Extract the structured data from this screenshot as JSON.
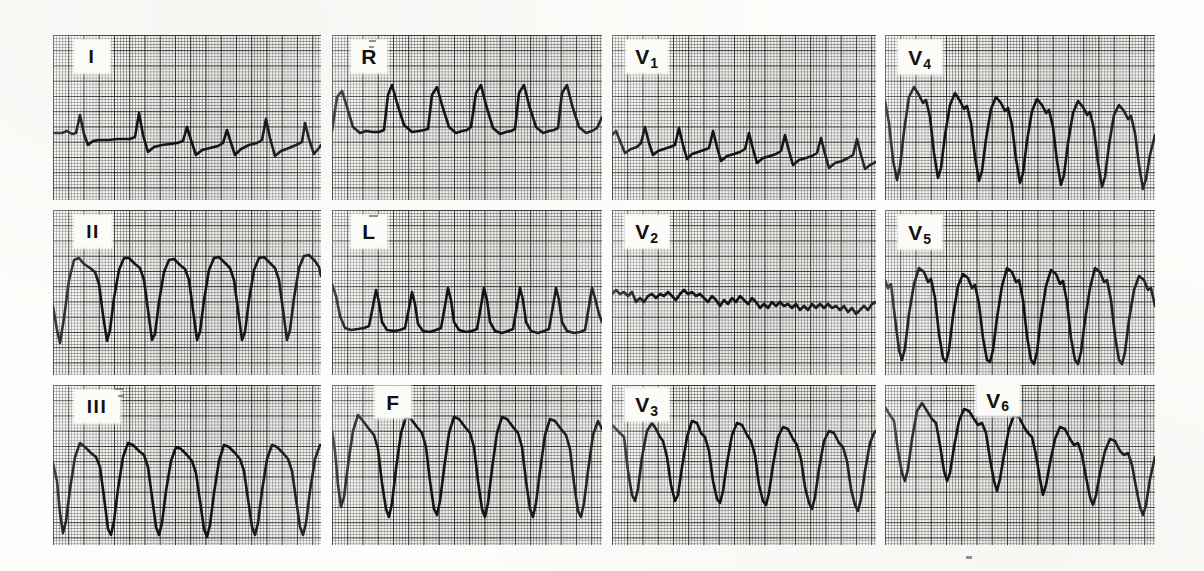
{
  "document": {
    "kind": "12-lead-electrocardiogram",
    "background_color": "#fdfdfb",
    "grid_color": "#282828",
    "trace_color": "#141414",
    "paper_color": "#f6f5f2"
  },
  "chart_data": {
    "type": "line",
    "title": "",
    "xlabel": "",
    "ylabel": "",
    "grid": true,
    "legend_position": "in-panel-label",
    "paper_speed": "25 mm/s",
    "small_square_px": 3.05,
    "large_square_px": 15.25,
    "layout": {
      "rows": 3,
      "columns": 4
    },
    "series": [
      {
        "name": "I",
        "row": 0,
        "col": 0,
        "label": "I",
        "subscript": "",
        "amplitude": "low",
        "morphology": "small upright spikes with shallow negative deflections on a near-isoelectric baseline"
      },
      {
        "name": "aVR",
        "row": 0,
        "col": 1,
        "label": "R",
        "subscript": "",
        "amplitude": "moderate",
        "morphology": "repeating upright peaked complexes with rounded troughs"
      },
      {
        "name": "V1",
        "row": 0,
        "col": 2,
        "label": "V",
        "subscript": "1",
        "amplitude": "low",
        "morphology": "small irregular spikes, mildly negative baseline drift to the right"
      },
      {
        "name": "V4",
        "row": 0,
        "col": 3,
        "label": "V",
        "subscript": "4",
        "amplitude": "very high",
        "morphology": "tall broad positive domes alternating with deep sharp negative spikes"
      },
      {
        "name": "II",
        "row": 1,
        "col": 0,
        "label": "II",
        "subscript": "",
        "amplitude": "very high",
        "morphology": "broad rounded positive plateaus with deep narrow downstrokes"
      },
      {
        "name": "aVL",
        "row": 1,
        "col": 1,
        "label": "L",
        "subscript": "",
        "amplitude": "moderate",
        "morphology": "narrow upright peaks separated by flat depressed baseline segments"
      },
      {
        "name": "V2",
        "row": 1,
        "col": 2,
        "label": "V",
        "subscript": "2",
        "amplitude": "very low",
        "morphology": "fine jagged low-voltage oscillation near the isoelectric line"
      },
      {
        "name": "V5",
        "row": 1,
        "col": 3,
        "label": "V",
        "subscript": "5",
        "amplitude": "very high",
        "morphology": "tall positive domes with notched descent and deep narrow negative spikes"
      },
      {
        "name": "III",
        "row": 2,
        "col": 0,
        "label": "III",
        "subscript": "",
        "amplitude": "very high",
        "morphology": "broad positive plateaus with deep narrow negative deflections"
      },
      {
        "name": "aVF",
        "row": 2,
        "col": 1,
        "label": "F",
        "subscript": "",
        "amplitude": "very high",
        "morphology": "broad positive domes with deep sharp negative downstrokes"
      },
      {
        "name": "V3",
        "row": 2,
        "col": 2,
        "label": "V",
        "subscript": "3",
        "amplitude": "high",
        "morphology": "positive notched peaks with deep narrow negative spikes"
      },
      {
        "name": "V6",
        "row": 2,
        "col": 3,
        "label": "V",
        "subscript": "6",
        "amplitude": "high",
        "morphology": "positive notched peaks with deep negative spikes, declining amplitude to the right"
      }
    ],
    "beats_per_panel": 7
  },
  "panels": [
    {
      "id": "lead-i",
      "label": "I",
      "subscript": "",
      "label_x": 22,
      "label_y": 6,
      "label_w": 34,
      "label_h": 31,
      "roman": true,
      "x": 53,
      "y": 35,
      "w": 268,
      "h": 165,
      "path": "M0,98 L9,98 L14,96 L19,99 L23,98 L27,80 L31,99 L35,110 L40,106 L46,105 L56,105 L64,104 L71,104 L77,104 L82,102 L86,78 L90,100 L95,117 L101,112 L109,110 L117,109 L124,108 L130,106 L134,92 L138,105 L143,120 L149,115 L157,113 L165,111 L170,108 L174,95 L178,108 L182,120 L188,114 L196,110 L204,108 L209,105 L213,84 L217,103 L222,121 L228,116 L236,113 L243,110 L249,107 L252,88 L256,104 L261,119 L266,113 L268,110"
    },
    {
      "id": "lead-avr",
      "label": "R",
      "subscript": "",
      "label_x": 20,
      "label_y": 6,
      "label_w": 34,
      "label_h": 31,
      "roman": false,
      "x": 332,
      "y": 35,
      "w": 270,
      "h": 165,
      "path": "M0,96 L5,62 L10,56 L15,72 L21,92 L28,98 L34,96 L41,97 L47,97 L52,95 L56,60 L60,50 L65,68 L72,90 L80,97 L87,96 L92,95 L96,94 L100,60 L105,52 L110,70 L117,92 L124,98 L130,96 L135,95 L139,92 L144,58 L149,50 L154,70 L161,93 L168,99 L174,97 L179,96 L183,94 L187,58 L192,50 L197,70 L204,92 L211,98 L217,96 L222,95 L226,93 L230,58 L235,50 L240,70 L247,92 L254,98 L260,96 L265,93 L270,82"
    },
    {
      "id": "lead-v1",
      "label": "V",
      "subscript": "1",
      "label_x": 15,
      "label_y": 6,
      "label_w": 40,
      "label_h": 31,
      "roman": false,
      "x": 612,
      "y": 35,
      "w": 264,
      "h": 165,
      "path": "M0,100 L4,96 L8,106 L13,118 L19,114 L25,112 L29,108 L33,92 L37,108 L41,120 L46,116 L52,114 L58,112 L63,110 L67,93 L71,110 L75,124 L80,119 L86,117 L92,115 L97,113 L101,96 L105,112 L109,126 L115,121 L122,119 L128,117 L133,114 L137,98 L141,114 L145,128 L151,123 L158,121 L164,119 L169,116 L173,100 L177,116 L181,130 L187,125 L194,123 L200,121 L205,118 L209,103 L213,119 L217,133 L223,128 L230,126 L236,123 L241,120 L245,104 L249,120 L253,134 L258,130 L264,127"
    },
    {
      "id": "lead-v4",
      "label": "V",
      "subscript": "4",
      "label_x": 14,
      "label_y": 6,
      "label_w": 42,
      "label_h": 32,
      "roman": false,
      "x": 885,
      "y": 35,
      "w": 270,
      "h": 165,
      "path": "M0,66 L4,88 L8,125 L12,145 L15,132 L19,96 L24,62 L29,52 L34,60 L38,68 L41,65 L45,82 L49,118 L53,143 L56,133 L60,100 L65,70 L70,58 L75,66 L79,74 L82,71 L86,88 L90,122 L94,146 L97,136 L101,104 L106,74 L111,62 L116,68 L120,76 L123,73 L127,90 L131,124 L135,148 L138,138 L142,106 L147,76 L152,64 L157,70 L161,78 L164,75 L168,92 L172,126 L176,150 L179,140 L183,108 L188,78 L193,66 L198,72 L202,80 L205,77 L209,94 L213,128 L217,152 L220,142 L224,110 L229,80 L234,70 L239,76 L243,84 L246,81 L250,98 L254,130 L258,154 L261,144 L265,120 L270,100"
    },
    {
      "id": "lead-ii",
      "label": "II",
      "subscript": "",
      "label_x": 22,
      "label_y": 6,
      "label_w": 36,
      "label_h": 31,
      "roman": true,
      "x": 53,
      "y": 210,
      "w": 268,
      "h": 165,
      "path": "M0,96 L4,120 L7,133 L11,108 L16,70 L21,50 L26,48 L31,54 L37,58 L42,62 L46,74 L50,105 L54,131 L57,120 L61,88 L66,60 L71,48 L76,48 L82,54 L87,58 L91,70 L95,100 L99,130 L102,124 L106,92 L111,62 L116,50 L121,49 L127,55 L132,59 L136,70 L140,100 L144,130 L147,122 L151,90 L156,60 L161,48 L166,47 L172,53 L177,58 L181,70 L185,100 L189,130 L192,122 L196,90 L201,60 L206,48 L211,47 L217,53 L222,58 L226,70 L230,100 L234,130 L237,120 L241,88 L246,58 L251,46 L256,45 L262,51 L266,57 L268,66"
    },
    {
      "id": "lead-avl",
      "label": "L",
      "subscript": "",
      "label_x": 20,
      "label_y": 6,
      "label_w": 34,
      "label_h": 31,
      "roman": false,
      "x": 332,
      "y": 210,
      "w": 270,
      "h": 165,
      "path": "M0,74 L4,86 L8,106 L13,118 L19,120 L26,119 L32,118 L37,116 L41,96 L44,80 L47,92 L50,112 L55,120 L62,121 L68,120 L73,118 L77,98 L80,82 L83,94 L86,114 L91,121 L98,122 L104,120 L109,118 L113,96 L116,78 L119,90 L122,112 L127,120 L134,122 L140,121 L145,119 L149,96 L152,78 L155,90 L158,112 L163,121 L170,123 L176,121 L181,119 L185,96 L188,78 L191,90 L194,112 L199,121 L206,123 L212,121 L217,119 L221,96 L224,78 L227,90 L230,112 L235,121 L242,123 L248,122 L253,120 L257,96 L260,78 L263,88 L267,104 L270,112"
    },
    {
      "id": "lead-v2",
      "label": "V",
      "subscript": "2",
      "label_x": 14,
      "label_y": 6,
      "label_w": 42,
      "label_h": 31,
      "roman": false,
      "x": 612,
      "y": 210,
      "w": 264,
      "h": 165,
      "path": "M0,84 L4,80 L8,84 L12,82 L16,86 L20,82 L24,92 L28,88 L32,92 L36,86 L40,84 L44,88 L48,84 L52,86 L56,82 L60,86 L64,90 L68,84 L72,80 L76,84 L80,82 L84,86 L88,84 L92,88 L96,92 L100,86 L104,90 L108,96 L112,90 L116,94 L120,88 L124,92 L128,86 L132,90 L136,94 L140,88 L144,92 L148,98 L152,94 L156,98 L160,92 L164,96 L168,92 L172,96 L176,94 L180,98 L184,94 L188,100 L192,96 L196,100 L200,94 L204,98 L208,94 L212,98 L216,94 L220,98 L224,96 L228,100 L232,96 L236,102 L240,98 L244,104 L248,100 L252,96 L256,100 L260,94 L264,92"
    },
    {
      "id": "lead-v5",
      "label": "V",
      "subscript": "5",
      "label_x": 14,
      "label_y": 6,
      "label_w": 42,
      "label_h": 32,
      "roman": false,
      "x": 885,
      "y": 210,
      "w": 270,
      "h": 165,
      "path": "M0,70 L3,78 L6,74 L10,108 L14,140 L17,150 L20,138 L24,104 L29,74 L34,58 L39,62 L43,72 L46,69 L50,88 L54,124 L58,148 L61,152 L64,140 L68,106 L73,76 L78,64 L83,68 L87,78 L90,75 L94,94 L98,128 L102,150 L105,152 L108,140 L112,108 L117,76 L122,58 L127,62 L131,72 L134,70 L138,90 L142,126 L146,150 L149,154 L152,142 L156,108 L161,76 L166,60 L171,64 L175,74 L178,71 L182,92 L186,128 L190,150 L193,154 L196,142 L200,110 L205,78 L210,58 L215,62 L219,72 L222,70 L226,90 L230,126 L234,150 L237,154 L240,142 L244,110 L249,80 L254,66 L259,70 L263,80 L266,78 L270,96"
    },
    {
      "id": "lead-iii",
      "label": "III",
      "subscript": "",
      "label_x": 22,
      "label_y": 6,
      "label_w": 44,
      "label_h": 31,
      "roman": true,
      "x": 53,
      "y": 385,
      "w": 268,
      "h": 160,
      "path": "M0,78 L4,96 L7,128 L10,148 L13,136 L17,104 L22,72 L27,58 L32,62 L38,68 L43,72 L47,82 L51,112 L55,144 L58,150 L61,136 L65,104 L70,72 L75,58 L80,60 L86,66 L91,70 L95,82 L99,112 L103,142 L106,150 L109,138 L113,106 L118,76 L123,62 L128,64 L134,70 L139,76 L143,88 L147,116 L151,144 L154,152 L157,140 L161,108 L166,76 L171,60 L176,62 L182,68 L187,74 L191,86 L195,114 L199,142 L202,150 L205,138 L209,106 L214,74 L219,60 L224,62 L230,68 L235,74 L239,86 L243,114 L247,142 L250,150 L253,138 L257,106 L262,74 L267,60 L268,60"
    },
    {
      "id": "lead-avf",
      "label": "F",
      "subscript": "",
      "label_x": 44,
      "label_y": 2,
      "label_w": 34,
      "label_h": 30,
      "roman": false,
      "x": 332,
      "y": 385,
      "w": 270,
      "h": 160,
      "path": "M0,46 L3,66 L6,100 L9,122 L12,112 L16,80 L21,46 L26,30 L31,36 L37,44 L42,50 L46,64 L50,98 L54,124 L57,132 L60,118 L64,84 L69,48 L74,32 L79,34 L85,42 L90,48 L94,62 L98,96 L102,124 L105,130 L108,116 L112,84 L117,48 L122,32 L127,34 L133,42 L138,48 L142,62 L146,96 L150,124 L153,132 L156,118 L160,84 L165,48 L170,32 L175,34 L181,42 L186,48 L190,62 L194,96 L198,124 L201,132 L204,118 L208,86 L213,50 L218,34 L223,36 L229,44 L234,50 L238,64 L242,98 L246,126 L249,132 L252,118 L256,86 L261,50 L266,36 L270,44"
    },
    {
      "id": "lead-v3",
      "label": "V",
      "subscript": "3",
      "label_x": 14,
      "label_y": 4,
      "label_w": 42,
      "label_h": 31,
      "roman": false,
      "x": 612,
      "y": 385,
      "w": 264,
      "h": 160,
      "path": "M0,40 L4,44 L8,48 L12,52 L16,86 L20,110 L23,116 L26,104 L30,72 L35,46 L40,38 L44,44 L48,52 L51,56 L55,72 L59,100 L63,116 L66,110 L70,82 L75,52 L80,36 L85,38 L89,48 L93,52 L97,66 L101,96 L105,114 L108,118 L111,106 L115,78 L120,50 L125,38 L130,40 L135,50 L139,56 L143,70 L147,100 L151,116 L154,120 L157,108 L161,80 L166,52 L171,42 L176,44 L181,54 L185,60 L189,74 L193,102 L197,118 L200,124 L203,112 L207,84 L212,56 L217,46 L222,48 L227,58 L231,62 L235,76 L239,104 L243,120 L246,126 L249,114 L253,86 L258,58 L262,48 L264,46"
    },
    {
      "id": "lead-v6",
      "label": "V",
      "subscript": "6",
      "label_x": 92,
      "label_y": 0,
      "label_w": 42,
      "label_h": 30,
      "roman": false,
      "x": 885,
      "y": 385,
      "w": 270,
      "h": 160,
      "path": "M0,22 L5,30 L9,36 L13,66 L17,88 L20,96 L23,84 L27,54 L32,26 L37,18 L42,26 L47,34 L51,38 L55,60 L59,86 L62,96 L65,88 L69,62 L74,36 L79,24 L84,26 L89,34 L93,40 L97,38 L101,48 L105,74 L109,96 L112,106 L115,94 L119,70 L124,44 L129,30 L134,32 L139,42 L143,48 L147,52 L151,70 L155,94 L158,110 L161,100 L165,78 L170,54 L175,42 L180,44 L185,54 L189,60 L193,58 L197,70 L201,92 L205,112 L208,120 L211,110 L215,88 L220,66 L225,54 L230,56 L235,66 L239,70 L243,68 L247,80 L251,102 L255,122 L258,130 L261,120 L265,94 L270,72"
    }
  ]
}
